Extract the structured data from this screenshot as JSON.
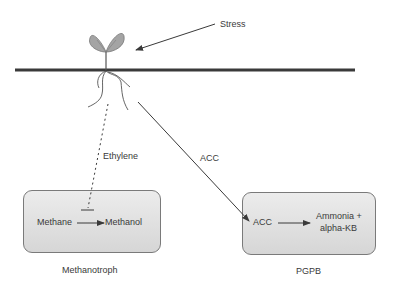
{
  "diagram": {
    "stress_label": "Stress",
    "ethylene_label": "Ethylene",
    "acc_signal_label": "ACC",
    "methanotroph": {
      "caption": "Methanotroph",
      "substrate": "Methane",
      "product": "Methanol"
    },
    "pgpb": {
      "caption": "PGPB",
      "substrate": "ACC",
      "product_line1": "Ammonia +",
      "product_line2": "alpha-KB"
    },
    "colors": {
      "line": "#3a3a3a",
      "box_border": "#7a7a7a",
      "box_fill_top": "#ececec",
      "box_fill_bottom": "#d6d6d6",
      "leaf": "#9a9a9a"
    }
  }
}
